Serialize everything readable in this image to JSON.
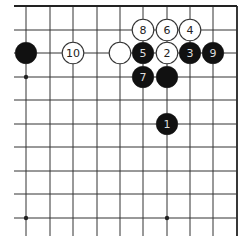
{
  "diagram": {
    "type": "go-board-diagram",
    "board_region": "top-right corner",
    "grid": {
      "columns": 10,
      "rows": 10,
      "x_lines": [
        26,
        50,
        73,
        97,
        120,
        143,
        167,
        190,
        213,
        237
      ],
      "y_lines": [
        6,
        30,
        53,
        77,
        100,
        124,
        147,
        171,
        194,
        218
      ],
      "edge_right": true,
      "edge_top": true,
      "line_color": "#333333",
      "edge_color": "#222222"
    },
    "star_points": [
      {
        "col": 0,
        "row": 3
      },
      {
        "col": 0,
        "row": 9
      },
      {
        "col": 6,
        "row": 9
      }
    ],
    "stones": [
      {
        "color": "black",
        "col": 0,
        "row": 2,
        "label": ""
      },
      {
        "color": "white",
        "col": 2,
        "row": 2,
        "label": "10"
      },
      {
        "color": "white",
        "col": 4,
        "row": 2,
        "label": ""
      },
      {
        "color": "black",
        "col": 5,
        "row": 2,
        "label": "5"
      },
      {
        "color": "white",
        "col": 6,
        "row": 2,
        "label": "2"
      },
      {
        "color": "black",
        "col": 7,
        "row": 2,
        "label": "3"
      },
      {
        "color": "black",
        "col": 8,
        "row": 2,
        "label": "9"
      },
      {
        "color": "white",
        "col": 5,
        "row": 1,
        "label": "8"
      },
      {
        "color": "white",
        "col": 6,
        "row": 1,
        "label": "6"
      },
      {
        "color": "white",
        "col": 7,
        "row": 1,
        "label": "4"
      },
      {
        "color": "black",
        "col": 5,
        "row": 3,
        "label": "7"
      },
      {
        "color": "black",
        "col": 6,
        "row": 3,
        "label": ""
      },
      {
        "color": "black",
        "col": 6,
        "row": 5,
        "label": "1"
      }
    ],
    "colors": {
      "black_stone": "#111111",
      "white_stone": "#ffffff",
      "white_stone_border": "#333333",
      "black_label": "#dddddd",
      "white_label": "#222222"
    }
  }
}
